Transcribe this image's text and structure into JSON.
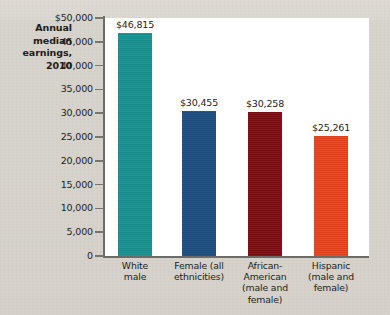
{
  "chart_data": {
    "type": "bar",
    "title_lines": [
      "Annual",
      "median",
      "earnings,",
      "2010"
    ],
    "xlabel": "",
    "ylabel": "",
    "ylim": [
      0,
      50000
    ],
    "grid": false,
    "legend": "none",
    "y_ticks": [
      {
        "value": 50000,
        "label": "$50,000"
      },
      {
        "value": 45000,
        "label": "45,000"
      },
      {
        "value": 40000,
        "label": "40,000"
      },
      {
        "value": 35000,
        "label": "35,000"
      },
      {
        "value": 30000,
        "label": "30,000"
      },
      {
        "value": 25000,
        "label": "25,000"
      },
      {
        "value": 20000,
        "label": "20,000"
      },
      {
        "value": 15000,
        "label": "15,000"
      },
      {
        "value": 10000,
        "label": "10,000"
      },
      {
        "value": 5000,
        "label": "5,000"
      },
      {
        "value": 0,
        "label": "0"
      }
    ],
    "categories": [
      "White male",
      "Female (all ethnicities)",
      "African-American (male and female)",
      "Hispanic (male and female)"
    ],
    "category_lines": [
      [
        "White",
        "male"
      ],
      [
        "Female (all",
        "ethnicities)"
      ],
      [
        "African-",
        "American",
        "(male and",
        "female)"
      ],
      [
        "Hispanic",
        "(male and",
        "female)"
      ]
    ],
    "values": [
      46815,
      30455,
      30258,
      25261
    ],
    "value_labels": [
      "$46,815",
      "$30,455",
      "$30,258",
      "$25,261"
    ],
    "colors": [
      "#17918f",
      "#1b4e80",
      "#7d0d11",
      "#e8431c"
    ]
  },
  "colors": {
    "page_background": "#d6d2cb",
    "plot_background": "#ffffff",
    "axis": "#6b6b68",
    "text": "#1d1d1b"
  }
}
